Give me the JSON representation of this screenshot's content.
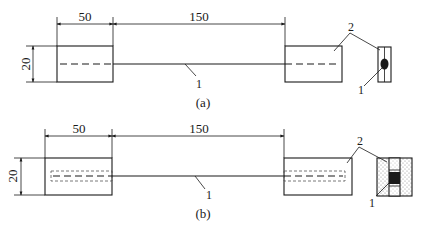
{
  "figure_a": {
    "caption": "(a)",
    "dim_left": "50",
    "dim_middle": "150",
    "dim_height": "20",
    "label_wire": "1",
    "label_block": "2",
    "label_cross_wire": "1"
  },
  "figure_b": {
    "caption": "(b)",
    "dim_left": "50",
    "dim_middle": "150",
    "dim_height": "20",
    "label_wire": "1",
    "label_block": "2",
    "label_cross_wire": "1"
  },
  "colors": {
    "line": "#1a1a1a",
    "background": "#ffffff",
    "fill_dots": "#888888"
  }
}
